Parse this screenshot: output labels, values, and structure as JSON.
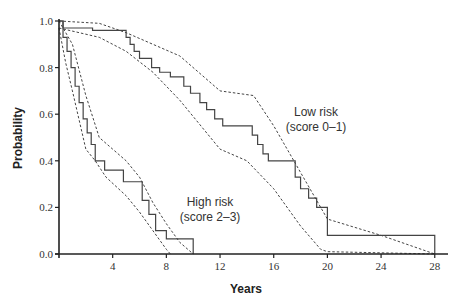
{
  "chart_data": {
    "type": "line",
    "subtype": "kaplan-meier",
    "title": "",
    "xlabel": "Years",
    "ylabel": "Probability",
    "xlim": [
      0,
      29
    ],
    "ylim": [
      0,
      1.0
    ],
    "xticks": [
      4,
      8,
      12,
      16,
      20,
      24,
      28
    ],
    "yticks": [
      0.0,
      0.2,
      0.4,
      0.6,
      0.8,
      1.0
    ],
    "ytick_labels": [
      "0.0",
      "0.2",
      "0.4",
      "0.6",
      "0.8",
      "1.0"
    ],
    "grid": false,
    "legend": "none (inline annotations)",
    "series": [
      {
        "name": "Low risk (score 0–1)",
        "style": "solid step",
        "x": [
          0,
          0.3,
          2.5,
          5.0,
          5.3,
          5.6,
          6.0,
          6.9,
          7.5,
          8.3,
          9.3,
          9.8,
          10.5,
          11.0,
          11.6,
          12.2,
          14.4,
          14.8,
          15.2,
          15.6,
          17.6,
          18.0,
          18.6,
          19.2,
          20.0,
          28.0
        ],
        "values": [
          1.0,
          0.97,
          0.96,
          0.93,
          0.9,
          0.87,
          0.84,
          0.8,
          0.78,
          0.76,
          0.72,
          0.69,
          0.65,
          0.62,
          0.58,
          0.55,
          0.51,
          0.47,
          0.43,
          0.4,
          0.33,
          0.28,
          0.24,
          0.2,
          0.08,
          0.0
        ]
      },
      {
        "name": "Low risk upper 95% CI",
        "style": "dashed",
        "x": [
          0,
          3,
          5,
          7,
          9,
          12,
          14.5,
          16,
          18,
          20,
          24,
          28
        ],
        "values": [
          1.0,
          0.99,
          0.95,
          0.9,
          0.85,
          0.7,
          0.68,
          0.55,
          0.35,
          0.15,
          0.08,
          0.0
        ]
      },
      {
        "name": "Low risk lower 95% CI",
        "style": "dashed",
        "x": [
          0,
          3,
          5,
          7,
          9,
          12,
          14,
          16,
          18,
          19.5,
          20,
          28
        ],
        "values": [
          0.97,
          0.93,
          0.87,
          0.78,
          0.66,
          0.45,
          0.4,
          0.28,
          0.12,
          0.02,
          0.01,
          0.0
        ]
      },
      {
        "name": "High risk (score 2–3)",
        "style": "solid step",
        "x": [
          0,
          0.3,
          0.6,
          0.9,
          1.2,
          1.5,
          1.8,
          2.1,
          2.4,
          2.7,
          3.4,
          4.8,
          6.2,
          6.7,
          7.2,
          8.0,
          10.0
        ],
        "values": [
          1.0,
          0.93,
          0.87,
          0.8,
          0.72,
          0.65,
          0.58,
          0.52,
          0.47,
          0.4,
          0.36,
          0.31,
          0.23,
          0.17,
          0.1,
          0.065,
          0.0
        ]
      },
      {
        "name": "High risk upper 95% CI",
        "style": "dashed",
        "x": [
          0,
          1,
          2,
          3,
          4,
          5,
          6,
          7,
          8,
          9,
          10
        ],
        "values": [
          1.0,
          0.9,
          0.68,
          0.5,
          0.45,
          0.4,
          0.33,
          0.22,
          0.13,
          0.05,
          0.0
        ]
      },
      {
        "name": "High risk lower 95% CI",
        "style": "dashed",
        "x": [
          0,
          0.5,
          1,
          2,
          2.7,
          3.5,
          5,
          6,
          7,
          8,
          8.3
        ],
        "values": [
          0.97,
          0.82,
          0.7,
          0.45,
          0.4,
          0.33,
          0.25,
          0.18,
          0.1,
          0.02,
          0.0
        ]
      }
    ],
    "annotations": [
      {
        "text": "Low risk",
        "x": 18.5,
        "y": 0.62
      },
      {
        "text": "(score 0–1)",
        "x": 18.5,
        "y": 0.55
      },
      {
        "text": "High risk",
        "x": 10.5,
        "y": 0.2
      },
      {
        "text": "(score 2–3)",
        "x": 10.5,
        "y": 0.13
      }
    ]
  },
  "labels": {
    "xlabel": "Years",
    "ylabel": "Probability",
    "low_risk_line1": "Low risk",
    "low_risk_line2": "(score 0–1)",
    "high_risk_line1": "High risk",
    "high_risk_line2": "(score 2–3)"
  }
}
